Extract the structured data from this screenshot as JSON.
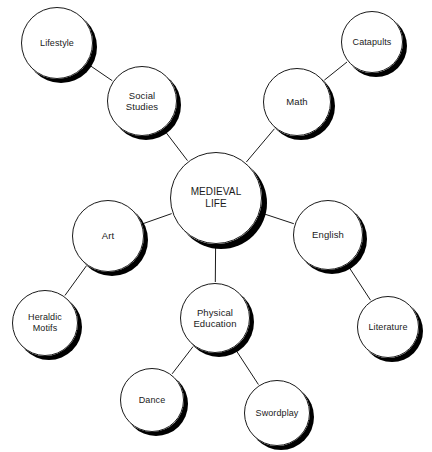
{
  "diagram": {
    "type": "mind-map",
    "background_color": "#ffffff",
    "stroke_color": "#1a1a1a",
    "shadow_color": "#000000",
    "center": {
      "id": "medieval-life",
      "label": "MEDIEVAL\nLIFE",
      "cx": 216,
      "cy": 198,
      "r": 46,
      "tier": "central"
    },
    "nodes": [
      {
        "id": "social-studies",
        "label": "Social\nStudies",
        "cx": 142,
        "cy": 101,
        "r": 35,
        "tier": "branch"
      },
      {
        "id": "lifestyle",
        "label": "Lifestyle",
        "cx": 57,
        "cy": 43,
        "r": 36,
        "tier": "leaf"
      },
      {
        "id": "math",
        "label": "Math",
        "cx": 297,
        "cy": 102,
        "r": 34,
        "tier": "branch"
      },
      {
        "id": "catapults",
        "label": "Catapults",
        "cx": 372,
        "cy": 42,
        "r": 31,
        "tier": "leaf"
      },
      {
        "id": "art",
        "label": "Art",
        "cx": 108,
        "cy": 236,
        "r": 36,
        "tier": "branch"
      },
      {
        "id": "heraldic-motifs",
        "label": "Heraldic\nMotifs",
        "cx": 45,
        "cy": 323,
        "r": 33,
        "tier": "leaf"
      },
      {
        "id": "english",
        "label": "English",
        "cx": 328,
        "cy": 235,
        "r": 35,
        "tier": "branch"
      },
      {
        "id": "literature",
        "label": "Literature",
        "cx": 388,
        "cy": 327,
        "r": 31,
        "tier": "leaf"
      },
      {
        "id": "physical-education",
        "label": "Physical\nEducation",
        "cx": 215,
        "cy": 318,
        "r": 35,
        "tier": "branch"
      },
      {
        "id": "dance",
        "label": "Dance",
        "cx": 152,
        "cy": 400,
        "r": 32,
        "tier": "leaf"
      },
      {
        "id": "swordplay",
        "label": "Swordplay",
        "cx": 277,
        "cy": 413,
        "r": 33,
        "tier": "leaf"
      }
    ],
    "edges": [
      {
        "from": "medieval-life",
        "to": "social-studies"
      },
      {
        "from": "medieval-life",
        "to": "math"
      },
      {
        "from": "medieval-life",
        "to": "art"
      },
      {
        "from": "medieval-life",
        "to": "english"
      },
      {
        "from": "medieval-life",
        "to": "physical-education"
      },
      {
        "from": "social-studies",
        "to": "lifestyle"
      },
      {
        "from": "math",
        "to": "catapults"
      },
      {
        "from": "art",
        "to": "heraldic-motifs"
      },
      {
        "from": "english",
        "to": "literature"
      },
      {
        "from": "physical-education",
        "to": "dance"
      },
      {
        "from": "physical-education",
        "to": "swordplay"
      }
    ],
    "labels": {
      "medieval-life": "MEDIEVAL LIFE",
      "social-studies": "Social Studies",
      "lifestyle": "Lifestyle",
      "math": "Math",
      "catapults": "Catapults",
      "art": "Art",
      "heraldic-motifs": "Heraldic Motifs",
      "english": "English",
      "literature": "Literature",
      "physical-education": "Physical Education",
      "dance": "Dance",
      "swordplay": "Swordplay"
    }
  }
}
